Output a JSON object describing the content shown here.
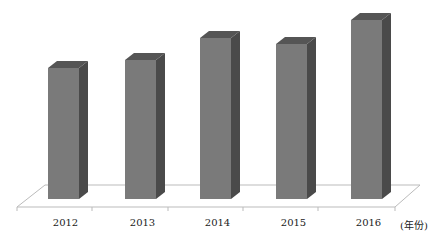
{
  "chart_data": {
    "type": "bar",
    "style": "3d-column",
    "title": "",
    "xlabel": "(年份)",
    "ylabel": "",
    "categories": [
      "2012",
      "2013",
      "2014",
      "2015",
      "2016"
    ],
    "values": [
      131,
      139,
      161,
      155,
      179
    ],
    "value_note": "relative bar heights (no y-axis shown)",
    "grid": false,
    "legend": null,
    "colors": {
      "front": "#7a7a7a",
      "top": "#555555",
      "side": "#4a4a4a",
      "floor": "#bbbbbb"
    }
  },
  "axis": {
    "unit_label": "(年份)",
    "tick_labels": [
      "2012",
      "2013",
      "2014",
      "2015",
      "2016"
    ]
  }
}
